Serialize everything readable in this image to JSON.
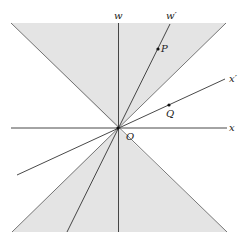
{
  "diagram": {
    "type": "spacetime light cone diagram",
    "cone_fill": "#e4e4e4",
    "line_color": "#333333",
    "axes": {
      "w": {
        "label": "w"
      },
      "x": {
        "label": "x"
      },
      "w_prime": {
        "label": "w′"
      },
      "x_prime": {
        "label": "x′"
      }
    },
    "origin": {
      "label": "O"
    },
    "points": [
      {
        "label": "P",
        "on_axis": "w′"
      },
      {
        "label": "Q",
        "on_axis": "x′"
      }
    ]
  }
}
